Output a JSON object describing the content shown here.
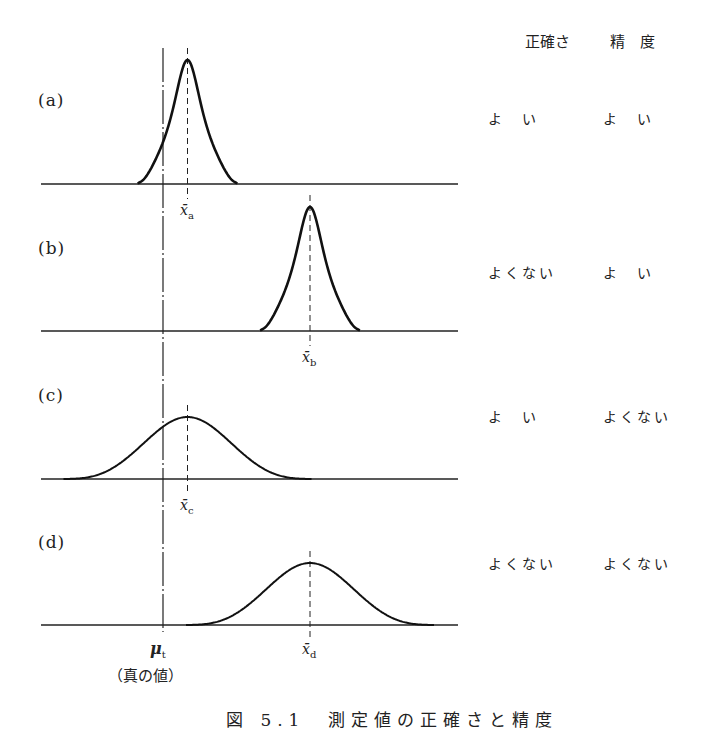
{
  "columns": {
    "accuracy": "正確さ",
    "precision": "精　度"
  },
  "panels": [
    {
      "id": "a",
      "label": "(a)",
      "mean_label": "x̄",
      "mean_sub": "a",
      "accuracy": "よ　い",
      "precision": "よ　い"
    },
    {
      "id": "b",
      "label": "(b)",
      "mean_label": "x̄",
      "mean_sub": "b",
      "accuracy": "よくない",
      "precision": "よ　い"
    },
    {
      "id": "c",
      "label": "(c)",
      "mean_label": "x̄",
      "mean_sub": "c",
      "accuracy": "よ　い",
      "precision": "よくない"
    },
    {
      "id": "d",
      "label": "(d)",
      "mean_label": "x̄",
      "mean_sub": "d",
      "accuracy": "よくない",
      "precision": "よくない"
    }
  ],
  "true_value": {
    "symbol": "μ",
    "sub": "t",
    "note": "（真の値）"
  },
  "caption": "図 5.1　測定値の正確さと精度",
  "chart_data": {
    "type": "line",
    "xlabel": "",
    "ylabel": "",
    "true_value_x": 0,
    "series": [
      {
        "name": "(a)",
        "mean": 1,
        "spread": "narrow",
        "relative_height": 1.0
      },
      {
        "name": "(b)",
        "mean": 6,
        "spread": "narrow",
        "relative_height": 1.0
      },
      {
        "name": "(c)",
        "mean": 1,
        "spread": "wide",
        "relative_height": 0.5
      },
      {
        "name": "(d)",
        "mean": 6,
        "spread": "wide",
        "relative_height": 0.5
      }
    ],
    "table": {
      "headers": [
        "",
        "正確さ",
        "精度"
      ],
      "rows": [
        [
          "(a)",
          "よい",
          "よい"
        ],
        [
          "(b)",
          "よくない",
          "よい"
        ],
        [
          "(c)",
          "よい",
          "よくない"
        ],
        [
          "(d)",
          "よくない",
          "よくない"
        ]
      ]
    }
  }
}
